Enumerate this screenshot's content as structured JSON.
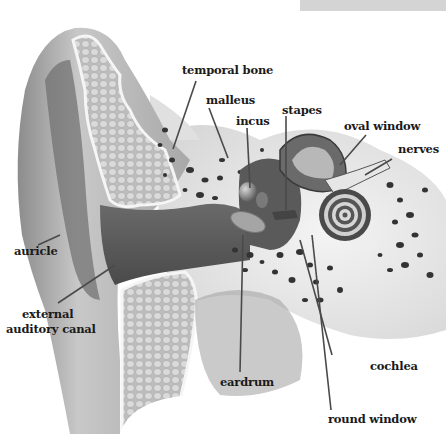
{
  "diagram": {
    "title_bar_color": "#d4d4d4",
    "palette": {
      "skin_outer": "#9a9a9a",
      "skin_mid": "#c2c2c2",
      "canal_dark": "#555555",
      "bone_light": "#e4e4e4",
      "bone_pore": "#3a3a3a",
      "cartilage": "#cfcfcf",
      "leader_line": "#4a4a4a",
      "label_text": "#1a1a1a"
    },
    "labels": [
      {
        "id": "temporal-bone",
        "text": "temporal bone"
      },
      {
        "id": "malleus",
        "text": "malleus"
      },
      {
        "id": "incus",
        "text": "incus"
      },
      {
        "id": "stapes",
        "text": "stapes"
      },
      {
        "id": "oval-window",
        "text": "oval window"
      },
      {
        "id": "nerves",
        "text": "nerves"
      },
      {
        "id": "auricle",
        "text": "auricle"
      },
      {
        "id": "external-auditory-canal-line1",
        "text": "external"
      },
      {
        "id": "external-auditory-canal-line2",
        "text": "auditory canal"
      },
      {
        "id": "eardrum",
        "text": "eardrum"
      },
      {
        "id": "cochlea",
        "text": "cochlea"
      },
      {
        "id": "round-window",
        "text": "round window"
      }
    ]
  }
}
